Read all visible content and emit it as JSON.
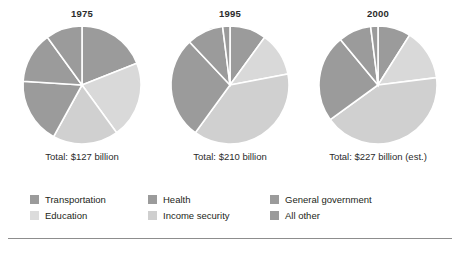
{
  "figure": {
    "background_color": "#ffffff",
    "rule_color": "#8d8d8d"
  },
  "palette": {
    "transportation": "#9b9b9b",
    "education": "#d9d9d9",
    "health": "#9b9b9b",
    "income_security": "#d0d0d0",
    "general_government": "#9b9b9b",
    "all_other": "#9b9b9b",
    "separator": "#ffffff"
  },
  "legend": {
    "items": [
      {
        "label": "Transportation",
        "color": "#9b9b9b"
      },
      {
        "label": "Education",
        "color": "#dcdcdc"
      },
      {
        "label": "Health",
        "color": "#9b9b9b"
      },
      {
        "label": "Income security",
        "color": "#cfcfcf"
      },
      {
        "label": "General government",
        "color": "#9b9b9b"
      },
      {
        "label": "All other",
        "color": "#9b9b9b"
      }
    ]
  },
  "charts": [
    {
      "year": "1975",
      "total": "Total: $127 billion"
    },
    {
      "year": "1995",
      "total": "Total: $210 billion"
    },
    {
      "year": "2000",
      "total": "Total: $227 billion (est.)"
    }
  ],
  "chart_data": [
    {
      "type": "pie",
      "title": "1975",
      "subtitle": "Total: $127 billion",
      "total_label": "Total: $127 billion",
      "total_value": 127,
      "units": "billion dollars",
      "categories": [
        "Transportation",
        "Education",
        "Income security",
        "All other",
        "Health",
        "General government"
      ],
      "values": [
        19,
        21,
        18,
        18,
        14,
        10
      ],
      "value_type": "percent",
      "legend_position": "bottom",
      "grid": false
    },
    {
      "type": "pie",
      "title": "1995",
      "subtitle": "Total: $210 billion",
      "total_label": "Total: $210 billion",
      "total_value": 210,
      "units": "billion dollars",
      "categories": [
        "Transportation",
        "Education",
        "Income security",
        "All other",
        "Health",
        "General government"
      ],
      "values": [
        10,
        12,
        38,
        28,
        10,
        2
      ],
      "value_type": "percent",
      "legend_position": "bottom",
      "grid": false
    },
    {
      "type": "pie",
      "title": "2000",
      "subtitle": "Total: $227 billion (est.)",
      "total_label": "Total: $227 billion (est.)",
      "total_value": 227,
      "units": "billion dollars",
      "categories": [
        "Transportation",
        "Education",
        "Income security",
        "All other",
        "Health",
        "General government"
      ],
      "values": [
        9,
        14,
        42,
        24,
        9,
        2
      ],
      "value_type": "percent",
      "legend_position": "bottom",
      "grid": false
    }
  ]
}
